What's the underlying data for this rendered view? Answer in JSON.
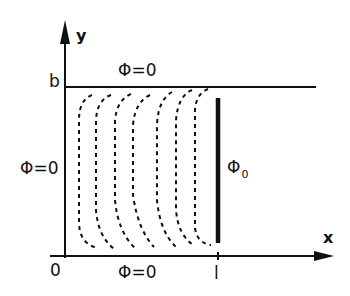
{
  "diagram": {
    "axes": {
      "x_label": "x",
      "y_label": "y",
      "origin_label": "0",
      "x_tick_label": "l",
      "y_tick_label": "b"
    },
    "boundary_conditions": {
      "top": "Φ=0",
      "left": "Φ=0",
      "bottom": "Φ=0",
      "electrode": "Φ",
      "electrode_subscript": "0"
    },
    "dashed_curves_count": 7,
    "colors": {
      "line": "#111111",
      "background": "#ffffff"
    }
  }
}
